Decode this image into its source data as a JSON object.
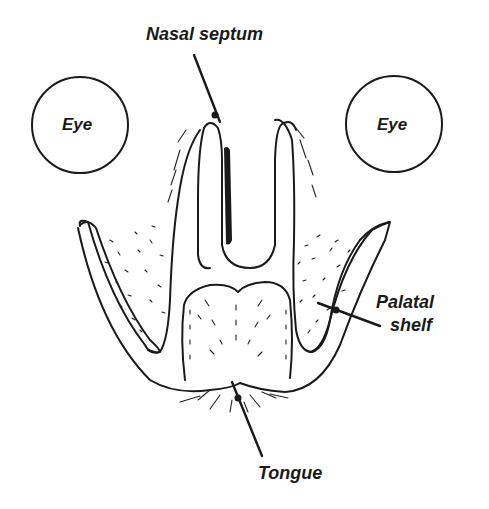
{
  "diagram": {
    "type": "anatomical-cross-section",
    "labels": {
      "nasal_septum": "Nasal septum",
      "eye_left": "Eye",
      "eye_right": "Eye",
      "palatal_shelf_line1": "Palatal",
      "palatal_shelf_line2": "shelf",
      "tongue": "Tongue"
    },
    "colors": {
      "ink": "#1a1a1a",
      "background": "#ffffff"
    }
  }
}
